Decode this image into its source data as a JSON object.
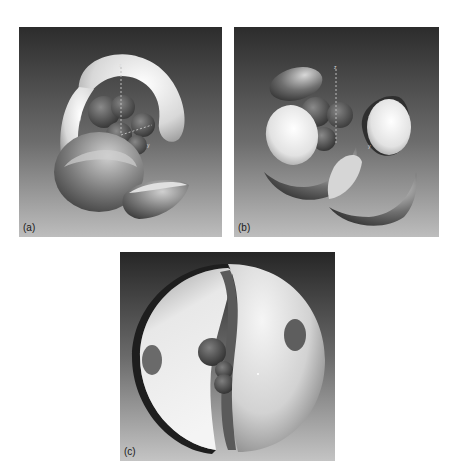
{
  "figure": {
    "panels": [
      {
        "id": "a",
        "label": "(a)",
        "description": "Molecular orbital surface lobes surrounding a central cluster of atoms with dashed z-axis",
        "axis_labels": {
          "z": "z",
          "y": "y"
        }
      },
      {
        "id": "b",
        "label": "(b)",
        "description": "Separated orbital lobes and shell fragments surrounding a central cluster of atoms with dashed z-axis",
        "axis_labels": {
          "z": "z",
          "y": "y"
        }
      },
      {
        "id": "c",
        "label": "(c)",
        "description": "Cut-open spherical shell with two circular holes revealing a central cluster of atoms"
      }
    ],
    "colors": {
      "background_top": "#2e2e2e",
      "background_bottom": "#b8b8b8",
      "surface_light": "#f2f2f2",
      "surface_dark": "#3a3a3a"
    }
  }
}
